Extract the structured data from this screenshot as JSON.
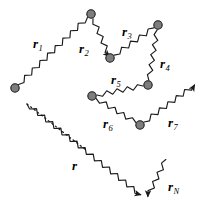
{
  "figure": {
    "background_color": "#ffffff",
    "stroke_color": "#1a1a1a",
    "node_fill": "#7d7d7d",
    "node_stroke": "#1a1a1a",
    "width": 205,
    "height": 212
  },
  "labels": {
    "r1": {
      "text": "r",
      "sub": "1",
      "x": 33,
      "y": 37
    },
    "r2": {
      "text": "r",
      "sub": "2",
      "x": 79,
      "y": 42
    },
    "r3": {
      "text": "r",
      "sub": "3",
      "x": 122,
      "y": 25
    },
    "r4": {
      "text": "r",
      "sub": "4",
      "x": 160,
      "y": 57
    },
    "r5": {
      "text": "r",
      "sub": "5",
      "x": 111,
      "y": 73
    },
    "r6": {
      "text": "r",
      "sub": "6",
      "x": 103,
      "y": 117
    },
    "r7": {
      "text": "r",
      "sub": "7",
      "x": 168,
      "y": 116
    },
    "r": {
      "text": "r",
      "sub": "",
      "x": 72,
      "y": 159
    },
    "rN": {
      "text": "r",
      "sub": "N",
      "x": 168,
      "y": 180
    }
  },
  "nodes": [
    {
      "name": "node-start-left",
      "cx": 15,
      "cy": 88,
      "r": 4.2
    },
    {
      "name": "node-top",
      "cx": 91,
      "cy": 14,
      "r": 4.2
    },
    {
      "name": "node-r2-r3",
      "cx": 110,
      "cy": 58,
      "r": 4.2
    },
    {
      "name": "node-r3-r4",
      "cx": 158,
      "cy": 25,
      "r": 4.2
    },
    {
      "name": "node-r4-r5",
      "cx": 148,
      "cy": 85,
      "r": 4.2
    },
    {
      "name": "node-r5-r6",
      "cx": 92,
      "cy": 96,
      "r": 4.2
    },
    {
      "name": "node-r6-r7",
      "cx": 140,
      "cy": 125,
      "r": 4.2
    }
  ],
  "segments": [
    {
      "name": "segment-r1",
      "label": "r1",
      "from": [
        15,
        88
      ],
      "to": [
        91,
        14
      ],
      "arrow": false
    },
    {
      "name": "segment-r2",
      "label": "r2",
      "from": [
        91,
        14
      ],
      "to": [
        110,
        58
      ],
      "arrow": true
    },
    {
      "name": "segment-r3",
      "label": "r3",
      "from": [
        110,
        58
      ],
      "to": [
        158,
        25
      ],
      "arrow": false
    },
    {
      "name": "segment-r4",
      "label": "r4",
      "from": [
        158,
        25
      ],
      "to": [
        148,
        85
      ],
      "arrow": false
    },
    {
      "name": "segment-r5",
      "label": "r5",
      "from": [
        148,
        85
      ],
      "to": [
        92,
        96
      ],
      "arrow": false
    },
    {
      "name": "segment-r6",
      "label": "r6",
      "from": [
        92,
        96
      ],
      "to": [
        140,
        125
      ],
      "arrow": false
    },
    {
      "name": "segment-r7",
      "label": "r7",
      "from": [
        140,
        125
      ],
      "to": [
        196,
        84
      ],
      "arrow": true
    },
    {
      "name": "segment-r-resultant",
      "label": "r",
      "from": [
        27,
        104
      ],
      "to": [
        142,
        196
      ],
      "arrow": true,
      "dashed_start": true
    },
    {
      "name": "segment-rN",
      "label": "rN",
      "from": [
        168,
        155
      ],
      "to": [
        147,
        198
      ],
      "arrow": true
    }
  ],
  "dashed_guide": {
    "name": "dashed-connector",
    "from": [
      27,
      104
    ],
    "to": [
      86,
      150
    ]
  }
}
